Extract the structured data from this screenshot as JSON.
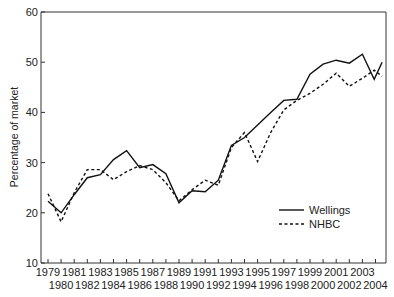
{
  "chart_data": {
    "type": "line",
    "title": "",
    "xlabel": "",
    "ylabel": "Percentage of market",
    "ylim": [
      10,
      60
    ],
    "yticks": [
      10,
      20,
      30,
      40,
      50,
      60
    ],
    "xlim": [
      1979,
      2004
    ],
    "x": [
      1979,
      1980,
      1981,
      1982,
      1983,
      1984,
      1985,
      1986,
      1987,
      1988,
      1989,
      1990,
      1991,
      1992,
      1993,
      1994,
      1995,
      1996,
      1997,
      1998,
      1999,
      2000,
      2001,
      2002,
      2003,
      2004
    ],
    "xtick_labels_top": [
      "1979",
      "1981",
      "1983",
      "1985",
      "1987",
      "1989",
      "1991",
      "1993",
      "1995",
      "1997",
      "1999",
      "2001",
      "2003"
    ],
    "xtick_labels_bottom": [
      "1980",
      "1982",
      "1984",
      "1986",
      "1988",
      "1990",
      "1992",
      "1994",
      "1996",
      "1998",
      "2000",
      "2002",
      "2004"
    ],
    "grid": false,
    "legend_position": "lower right (inside)",
    "series": [
      {
        "name": "Wellings",
        "style": "solid",
        "points": [
          [
            1979,
            22.3
          ],
          [
            1980,
            20.0
          ],
          [
            1981,
            23.6
          ],
          [
            1982,
            27.0
          ],
          [
            1983,
            27.6
          ],
          [
            1984,
            30.6
          ],
          [
            1985,
            32.4
          ],
          [
            1986,
            29.0
          ],
          [
            1987,
            29.6
          ],
          [
            1988,
            27.8
          ],
          [
            1989,
            22.0
          ],
          [
            1990,
            24.4
          ],
          [
            1991,
            24.2
          ],
          [
            1992,
            26.5
          ],
          [
            1993,
            33.4
          ],
          [
            1994,
            35.0
          ],
          [
            1995,
            37.5
          ],
          [
            1996,
            40.0
          ],
          [
            1997,
            42.4
          ],
          [
            1998,
            42.6
          ],
          [
            1999,
            47.6
          ],
          [
            2000,
            49.6
          ],
          [
            2001,
            50.4
          ],
          [
            2002,
            49.8
          ],
          [
            2003,
            51.6
          ],
          [
            2003.9,
            46.6
          ],
          [
            2004.5,
            50.0
          ]
        ]
      },
      {
        "name": "NHBC",
        "style": "dashed",
        "points": [
          [
            1979,
            23.8
          ],
          [
            1980,
            18.2
          ],
          [
            1981,
            24.0
          ],
          [
            1982,
            28.6
          ],
          [
            1983,
            28.6
          ],
          [
            1984,
            26.6
          ],
          [
            1985,
            28.2
          ],
          [
            1986,
            29.4
          ],
          [
            1987,
            28.6
          ],
          [
            1988,
            26.0
          ],
          [
            1989,
            22.4
          ],
          [
            1990,
            24.6
          ],
          [
            1991,
            26.5
          ],
          [
            1992,
            25.5
          ],
          [
            1993,
            33.0
          ],
          [
            1994,
            36.0
          ],
          [
            1995,
            30.2
          ],
          [
            1996,
            36.0
          ],
          [
            1997,
            40.5
          ],
          [
            1998,
            42.4
          ],
          [
            1999,
            43.8
          ],
          [
            2000,
            45.6
          ],
          [
            2001,
            47.8
          ],
          [
            2002,
            45.2
          ],
          [
            2003,
            46.8
          ],
          [
            2003.9,
            48.4
          ],
          [
            2004.5,
            47.2
          ]
        ]
      }
    ]
  },
  "legend": {
    "items": [
      {
        "label": "Wellings",
        "style": "solid"
      },
      {
        "label": "NHBC",
        "style": "dashed"
      }
    ]
  },
  "colors": {
    "line": "#111111",
    "axis": "#333333",
    "background": "#ffffff"
  }
}
